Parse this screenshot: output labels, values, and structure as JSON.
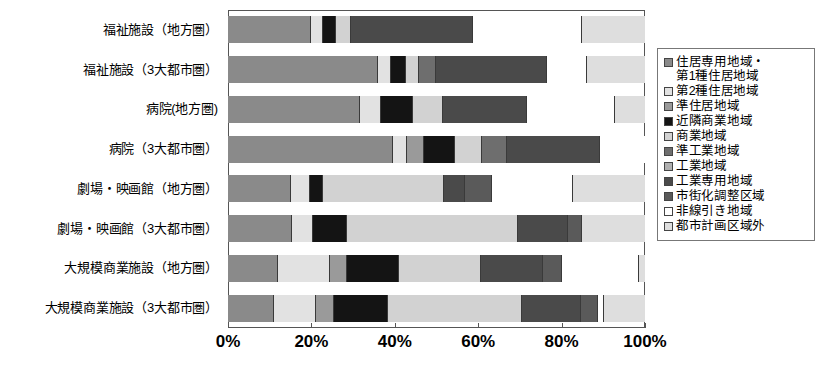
{
  "chart_data": {
    "type": "bar",
    "orientation": "horizontal",
    "stacked": true,
    "normalized": true,
    "title": "",
    "xlabel": "",
    "ylabel": "",
    "xlim": [
      0,
      100
    ],
    "xticks": [
      "0%",
      "20%",
      "40%",
      "60%",
      "80%",
      "100%"
    ],
    "xtick_values": [
      0,
      20,
      40,
      60,
      80,
      100
    ],
    "grid": false,
    "legend_position": "right",
    "categories": [
      "福祉施設（地方圏）",
      "福祉施設（3大都市圏）",
      "病院(地方圏)",
      "病院（3大都市圏）",
      "劇場・映画館（地方圏）",
      "劇場・映画館（3大都市圏）",
      "大規模商業施設（地方圏）",
      "大規模商業施設（3大都市圏）"
    ],
    "series": [
      {
        "name": "住居専用地域・第1種住居地域",
        "color": "#8a8a8a",
        "values": [
          19.8,
          36.0,
          31.3,
          39.5,
          15.0,
          15.4,
          12.0,
          11.0
        ]
      },
      {
        "name": "第2種住居地域",
        "color": "#e2e2e2",
        "values": [
          3.1,
          3.1,
          5.0,
          3.4,
          4.6,
          5.0,
          12.5,
          10.1
        ]
      },
      {
        "name": "準住居地域",
        "color": "#9a9a9a",
        "values": [
          0.0,
          0.0,
          0.0,
          4.1,
          0.0,
          0.0,
          4.1,
          4.3
        ]
      },
      {
        "name": "近隣商業地域",
        "color": "#141414",
        "values": [
          3.1,
          3.6,
          7.7,
          7.5,
          3.1,
          8.2,
          12.5,
          13.0
        ]
      },
      {
        "name": "商業地域",
        "color": "#d2d2d2",
        "values": [
          3.4,
          3.1,
          7.0,
          6.3,
          29.0,
          41.0,
          19.5,
          32.0
        ]
      },
      {
        "name": "準工業地域",
        "color": "#6e6e6e",
        "values": [
          0.0,
          4.1,
          0.0,
          6.0,
          0.0,
          0.0,
          0.0,
          0.0
        ]
      },
      {
        "name": "工業地域",
        "color": "#b0b0b0",
        "values": [
          0.0,
          0.0,
          0.0,
          0.0,
          0.0,
          0.0,
          0.0,
          0.0
        ]
      },
      {
        "name": "工業専用地域",
        "color": "#4a4a4a",
        "values": [
          29.4,
          26.6,
          20.0,
          22.3,
          5.1,
          12.0,
          15.0,
          14.3
        ]
      },
      {
        "name": "市街化調整区域",
        "color": "#5a5a5a",
        "values": [
          0.0,
          0.0,
          0.0,
          0.0,
          6.4,
          3.4,
          4.5,
          4.0
        ]
      },
      {
        "name": "非線引き地域",
        "color": "#ffffff",
        "values": [
          26.2,
          9.6,
          21.0,
          10.9,
          19.5,
          0.0,
          18.4,
          1.5
        ]
      },
      {
        "name": "都市計画区域外",
        "color": "#dedede",
        "values": [
          15.0,
          13.9,
          7.0,
          0.0,
          17.3,
          15.0,
          1.5,
          9.8
        ]
      }
    ]
  },
  "legend": {
    "items": [
      {
        "label_line1": "住居専用地域・",
        "label_line2": "第1種住居地域",
        "swatch": "#8a8a8a"
      },
      {
        "label_line1": "第2種住居地域",
        "label_line2": "",
        "swatch": "#e2e2e2"
      },
      {
        "label_line1": "準住居地域",
        "label_line2": "",
        "swatch": "#9a9a9a"
      },
      {
        "label_line1": "近隣商業地域",
        "label_line2": "",
        "swatch": "#141414"
      },
      {
        "label_line1": "商業地域",
        "label_line2": "",
        "swatch": "#d2d2d2"
      },
      {
        "label_line1": "準工業地域",
        "label_line2": "",
        "swatch": "#6e6e6e"
      },
      {
        "label_line1": "工業地域",
        "label_line2": "",
        "swatch": "#b0b0b0"
      },
      {
        "label_line1": "工業専用地域",
        "label_line2": "",
        "swatch": "#4a4a4a"
      },
      {
        "label_line1": "市街化調整区域",
        "label_line2": "",
        "swatch": "#5a5a5a"
      },
      {
        "label_line1": "非線引き地域",
        "label_line2": "",
        "swatch": "#ffffff"
      },
      {
        "label_line1": "都市計画区域外",
        "label_line2": "",
        "swatch": "#dedede"
      }
    ]
  },
  "axis": {
    "x_tick_labels": [
      "0%",
      "20%",
      "40%",
      "60%",
      "80%",
      "100%"
    ]
  }
}
